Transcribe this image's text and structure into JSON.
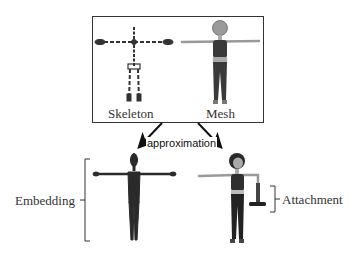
{
  "diagram": {
    "top_box": {
      "left_label": "Skeleton",
      "right_label": "Mesh"
    },
    "arrow_label": "approximation",
    "bottom": {
      "left_label": "Embedding",
      "right_label": "Attachment"
    },
    "colors": {
      "line": "#222222",
      "figure_dark": "#2a2a2a",
      "mesh_gray": "#8a8a8a",
      "skin": "#bdbdbd"
    }
  }
}
